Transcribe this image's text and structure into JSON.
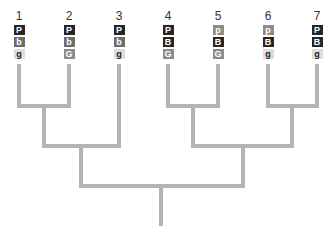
{
  "diagram": {
    "type": "dendrogram",
    "line_color": "#b4b4b4",
    "leaves": [
      {
        "label": "1",
        "x": 19,
        "genes": [
          {
            "text": "P",
            "shade": "dark"
          },
          {
            "text": "b",
            "shade": "mid"
          },
          {
            "text": "g",
            "shade": "light"
          }
        ]
      },
      {
        "label": "2",
        "x": 69,
        "genes": [
          {
            "text": "P",
            "shade": "dark"
          },
          {
            "text": "b",
            "shade": "mid"
          },
          {
            "text": "G",
            "shade": "midlight"
          }
        ]
      },
      {
        "label": "3",
        "x": 119,
        "genes": [
          {
            "text": "P",
            "shade": "dark"
          },
          {
            "text": "b",
            "shade": "mid"
          },
          {
            "text": "g",
            "shade": "light"
          }
        ]
      },
      {
        "label": "4",
        "x": 168,
        "genes": [
          {
            "text": "P",
            "shade": "dark"
          },
          {
            "text": "B",
            "shade": "dark"
          },
          {
            "text": "G",
            "shade": "midlight"
          }
        ]
      },
      {
        "label": "5",
        "x": 218,
        "genes": [
          {
            "text": "p",
            "shade": "midlight"
          },
          {
            "text": "B",
            "shade": "dark"
          },
          {
            "text": "G",
            "shade": "midlight"
          }
        ]
      },
      {
        "label": "6",
        "x": 268,
        "genes": [
          {
            "text": "p",
            "shade": "midlight"
          },
          {
            "text": "B",
            "shade": "dark"
          },
          {
            "text": "g",
            "shade": "light"
          }
        ]
      },
      {
        "label": "7",
        "x": 317,
        "genes": [
          {
            "text": "P",
            "shade": "dark"
          },
          {
            "text": "B",
            "shade": "dark"
          },
          {
            "text": "g",
            "shade": "light"
          }
        ]
      }
    ],
    "clades": [
      {
        "children": [
          "1",
          "2"
        ],
        "join_y": 106
      },
      {
        "children": [
          "(1,2)",
          "3"
        ],
        "join_y": 146
      },
      {
        "children": [
          "4",
          "5"
        ],
        "join_y": 106
      },
      {
        "children": [
          "6",
          "7"
        ],
        "join_y": 106
      },
      {
        "children": [
          "(4,5)",
          "(6,7)"
        ],
        "join_y": 146
      },
      {
        "children": [
          "((1,2),3)",
          "((4,5),(6,7))"
        ],
        "join_y": 186
      }
    ]
  }
}
